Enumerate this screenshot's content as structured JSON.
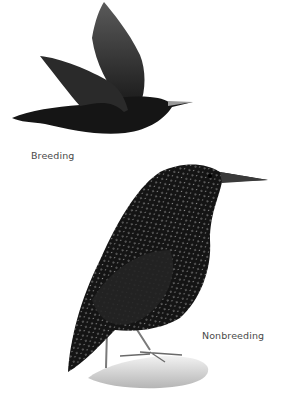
{
  "illustration": {
    "subject": "starling",
    "figures": [
      {
        "id": "breeding",
        "pose": "flying",
        "label": "Breeding"
      },
      {
        "id": "nonbreeding",
        "pose": "perched on rock",
        "label": "Nonbreeding"
      }
    ]
  },
  "colors": {
    "background": "#ffffff",
    "plumage_dark": "#151515",
    "wing_gray": "#4a4a4a",
    "spots": "#d8d8d8",
    "rock": "#d6d6d6",
    "label_text": "#4a4a4a"
  }
}
